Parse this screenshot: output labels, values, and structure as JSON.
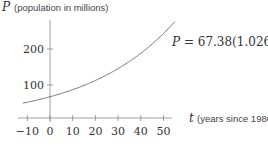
{
  "chart_data": {
    "type": "line",
    "title": "",
    "xlabel_var": "t",
    "xlabel_text": "(years since 1980)",
    "ylabel_var": "P",
    "ylabel_text": "(population in millions)",
    "x_ticks": [
      -10,
      0,
      10,
      20,
      30,
      40,
      50
    ],
    "x_tick_labels": [
      "−10",
      "0",
      "10",
      "20",
      "30",
      "40",
      "50"
    ],
    "y_ticks": [
      100,
      200
    ],
    "y_tick_labels": [
      "100",
      "200"
    ],
    "xlim": [
      -12,
      56
    ],
    "ylim": [
      0,
      290
    ],
    "grid": false,
    "series": [
      {
        "name": "P = 67.38(1.026)^t",
        "formula": {
          "a": 67.38,
          "b": 1.026
        },
        "x": [
          -12,
          -10,
          0,
          10,
          20,
          30,
          40,
          50,
          55
        ],
        "values": [
          49.4,
          52.0,
          67.4,
          87.1,
          112.6,
          145.5,
          188.1,
          243.2,
          276.4
        ]
      }
    ],
    "annotation": {
      "lhs": "P",
      "eq": " = 67.38(1.026)",
      "exp": "t"
    },
    "color": "#555555"
  }
}
